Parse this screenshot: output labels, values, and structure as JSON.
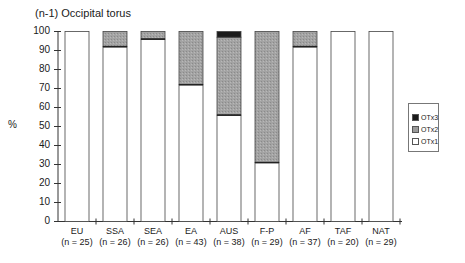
{
  "chart_data": {
    "type": "bar",
    "stacked": true,
    "title": "(n-1) Occipital torus",
    "xlabel": "",
    "ylabel": "%",
    "ylim": [
      0,
      100
    ],
    "yticks": [
      0,
      10,
      20,
      30,
      40,
      50,
      60,
      70,
      80,
      90,
      100
    ],
    "grid": false,
    "legend_position": "right",
    "categories": [
      "EU",
      "SSA",
      "SEA",
      "EA",
      "AUS",
      "F-P",
      "AF",
      "TAF",
      "NAT"
    ],
    "category_sublabels": [
      "(n = 25)",
      "(n = 26)",
      "(n = 26)",
      "(n = 43)",
      "(n = 38)",
      "(n = 29)",
      "(n = 37)",
      "(n = 20)",
      "(n = 29)"
    ],
    "series": [
      {
        "name": "OTx1",
        "color": "#ffffff",
        "values": [
          100,
          92,
          96,
          72,
          56,
          31,
          92,
          100,
          100
        ]
      },
      {
        "name": "OTx2",
        "color": "#9a9a9a",
        "values": [
          0,
          8,
          4,
          28,
          41,
          69,
          8,
          0,
          0
        ]
      },
      {
        "name": "OTx3",
        "color": "#1a1a1a",
        "values": [
          0,
          0,
          0,
          0,
          3,
          0,
          0,
          0,
          0
        ]
      }
    ]
  },
  "legend": {
    "items": [
      {
        "label": "OTx3",
        "color": "#1a1a1a"
      },
      {
        "label": "OTx2",
        "color": "#9a9a9a"
      },
      {
        "label": "OTx1",
        "color": "#ffffff"
      }
    ]
  }
}
